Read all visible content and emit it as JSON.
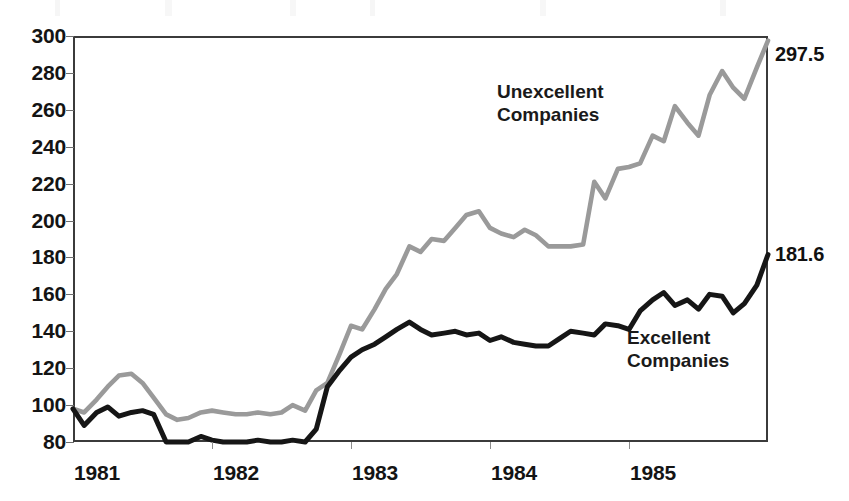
{
  "chart_data": {
    "type": "line",
    "title": "",
    "subtitle": "",
    "xlabel": "",
    "ylabel": "",
    "xlim": [
      1981.0,
      1986.0
    ],
    "ylim": [
      80,
      300
    ],
    "grid": false,
    "legend_position": "inline-annotations",
    "y_ticks": [
      300,
      280,
      260,
      240,
      220,
      200,
      180,
      160,
      140,
      120,
      100,
      80
    ],
    "x_ticks": [
      1981,
      1982,
      1983,
      1984,
      1985
    ],
    "x_tick_labels": [
      "1981",
      "1982",
      "1983",
      "1984",
      "1985"
    ],
    "x": [
      1981.0,
      1981.08,
      1981.17,
      1981.25,
      1981.33,
      1981.42,
      1981.5,
      1981.58,
      1981.67,
      1981.75,
      1981.83,
      1981.92,
      1982.0,
      1982.08,
      1982.17,
      1982.25,
      1982.33,
      1982.42,
      1982.5,
      1982.58,
      1982.67,
      1982.75,
      1982.83,
      1982.92,
      1983.0,
      1983.08,
      1983.17,
      1983.25,
      1983.33,
      1983.42,
      1983.5,
      1983.58,
      1983.67,
      1983.75,
      1983.83,
      1983.92,
      1984.0,
      1984.08,
      1984.17,
      1984.25,
      1984.33,
      1984.42,
      1984.5,
      1984.58,
      1984.67,
      1984.75,
      1984.83,
      1984.92,
      1985.0,
      1985.08,
      1985.17,
      1985.25,
      1985.33,
      1985.42,
      1985.5,
      1985.58,
      1985.67,
      1985.75,
      1985.83,
      1985.92,
      1986.0
    ],
    "series": [
      {
        "name": "Unexcellent Companies",
        "color": "#9a9a9a",
        "end_value": 297.5,
        "end_label": "297.5",
        "annotation": "Unexcellent Companies",
        "values": [
          98,
          96,
          103,
          110,
          116,
          117,
          112,
          104,
          95,
          92,
          93,
          96,
          97,
          96,
          95,
          95,
          96,
          95,
          96,
          100,
          97,
          108,
          112,
          128,
          143,
          141,
          152,
          163,
          171,
          186,
          183,
          190,
          189,
          196,
          203,
          205,
          196,
          193,
          191,
          195,
          192,
          186,
          186,
          186,
          187,
          221,
          212,
          228,
          229,
          231,
          246,
          243,
          262,
          253,
          246,
          268,
          281,
          272,
          266,
          283,
          297.5
        ]
      },
      {
        "name": "Excellent Companies",
        "color": "#161616",
        "end_value": 181.6,
        "end_label": "181.6",
        "annotation": "Excellent Companies",
        "values": [
          98,
          89,
          96,
          99,
          94,
          96,
          97,
          95,
          80,
          80,
          80,
          83,
          81,
          80,
          80,
          80,
          81,
          80,
          80,
          81,
          80,
          87,
          110,
          119,
          126,
          130,
          133,
          137,
          141,
          145,
          141,
          138,
          139,
          140,
          138,
          139,
          135,
          137,
          134,
          133,
          132,
          132,
          136,
          140,
          139,
          138,
          144,
          143,
          141,
          151,
          157,
          161,
          154,
          157,
          152,
          160,
          159,
          150,
          155,
          165,
          181.6
        ]
      }
    ],
    "annotations": [
      {
        "text": "Unexcellent Companies",
        "series": "Unexcellent Companies"
      },
      {
        "text": "Excellent Companies",
        "series": "Excellent Companies"
      }
    ]
  },
  "axis": {
    "y_labels": [
      "300",
      "280",
      "260",
      "240",
      "220",
      "200",
      "180",
      "160",
      "140",
      "120",
      "100",
      "80"
    ],
    "x_labels": [
      "1981",
      "1982",
      "1983",
      "1984",
      "1985"
    ]
  },
  "labels": {
    "unexcellent_end": "297.5",
    "excellent_end": "181.6",
    "unexcellent_name_line1": "Unexcellent",
    "unexcellent_name_line2": "Companies",
    "excellent_name_line1": "Excellent",
    "excellent_name_line2": "Companies"
  },
  "colors": {
    "unexcellent_line": "#9a9a9a",
    "excellent_line": "#161616",
    "frame": "#3b3b3b",
    "text": "#141414",
    "background": "#ffffff"
  }
}
